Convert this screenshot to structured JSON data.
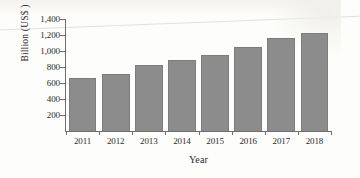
{
  "chart_data": {
    "type": "bar",
    "title": "",
    "xlabel": "Year",
    "ylabel": "Billion (US$ )",
    "categories": [
      "2011",
      "2012",
      "2013",
      "2014",
      "2015",
      "2016",
      "2017",
      "2018"
    ],
    "values": [
      660,
      710,
      825,
      885,
      955,
      1045,
      1165,
      1230
    ],
    "ylim": [
      0,
      1400
    ],
    "ytick_labels": [
      "1,400",
      "1,200",
      "1,000",
      "800",
      "600",
      "400",
      "200"
    ],
    "ytick_values": [
      1400,
      1200,
      1000,
      800,
      600,
      400,
      200
    ],
    "grid": false,
    "legend": null,
    "bar_color": "#8c8c8c",
    "bar_edge_color": "#7c7c7c",
    "axis_color": "#6f6f6f",
    "background_color": "#fdfdfb"
  }
}
